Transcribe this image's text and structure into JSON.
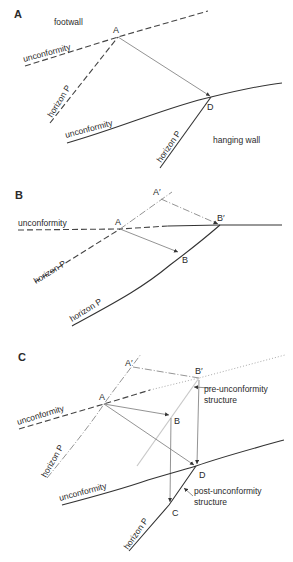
{
  "panels": {
    "a": {
      "label": "A",
      "footwall": "footwall",
      "hanging_wall": "hanging wall",
      "unconformity_upper": "unconformity",
      "unconformity_lower": "unconformity",
      "horizon_upper": "horizon P",
      "horizon_lower": "horizon P",
      "point_a": "A",
      "point_d": "D"
    },
    "b": {
      "label": "B",
      "unconformity": "unconformity",
      "horizon_upper": "horizon P",
      "horizon_lower": "horizon P",
      "point_a": "A",
      "point_a_prime": "A′",
      "point_b": "B",
      "point_b_prime": "B′"
    },
    "c": {
      "label": "C",
      "unconformity_upper": "unconformity",
      "unconformity_lower": "unconformity",
      "horizon_upper": "horizon P",
      "horizon_lower": "horizon P",
      "point_a": "A",
      "point_a_prime": "A′",
      "point_b": "B",
      "point_b_prime": "B′",
      "point_c": "C",
      "point_d": "D",
      "pre_line1": "pre-unconformity",
      "pre_line2": "structure",
      "post_line1": "post-unconformity",
      "post_line2": "structure"
    }
  }
}
